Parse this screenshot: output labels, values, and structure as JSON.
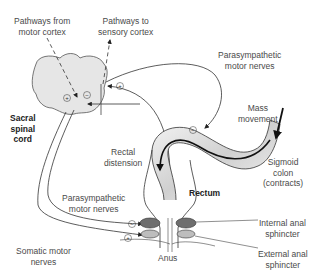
{
  "figure": {
    "type": "anatomical-physiology-diagram",
    "colors": {
      "spinal_cord_fill": "#e6e6e6",
      "line": "#333333",
      "text": "#4a4a4a",
      "internal_sphincter": "#6e6e6e",
      "external_sphincter": "#bdbdbd",
      "colon_shade": "#cfcfcf"
    }
  },
  "labels": {
    "pathways_from_motor": [
      "Pathways from",
      "motor cortex"
    ],
    "pathways_to_sensory": [
      "Pathways to",
      "sensory cortex"
    ],
    "parasympathetic_top": [
      "Parasympathetic",
      "motor nerves"
    ],
    "mass_movement": [
      "Mass",
      "movement"
    ],
    "sacral_spinal_cord": [
      "Sacral",
      "spinal",
      "cord"
    ],
    "rectal_distension": [
      "Rectal",
      "distension"
    ],
    "sigmoid_colon": [
      "Sigmoid",
      "colon",
      "(contracts)"
    ],
    "rectum": "Rectum",
    "parasympathetic_bottom": [
      "Parasympathetic",
      "motor nerves"
    ],
    "internal_sphincter": [
      "Internal anal",
      "sphincter"
    ],
    "somatic_motor": [
      "Somatic motor",
      "nerves"
    ],
    "external_sphincter": [
      "External anal",
      "sphincter"
    ],
    "anus": "Anus"
  },
  "signs": {
    "plus": "+",
    "minus": "−"
  }
}
